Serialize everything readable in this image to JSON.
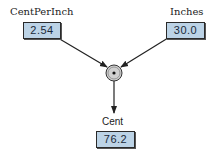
{
  "nodes": {
    "cent_per_inch": {
      "label": "CentPerInch",
      "value": "2.54"
    },
    "inches": {
      "label": "Inches",
      "value": "30.0"
    },
    "cent": {
      "label": "Cent",
      "value": "76.2"
    }
  },
  "operator": {
    "symbol": "*",
    "name": "multiply"
  },
  "colors": {
    "box_fill": "#bcd3e6",
    "operator_fill": "#d0d0d0",
    "line": "#222222"
  }
}
